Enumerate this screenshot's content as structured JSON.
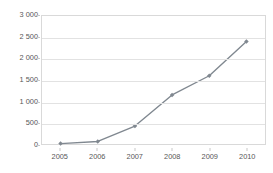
{
  "chart_data": {
    "type": "line",
    "title": "",
    "subtitle": "",
    "xlabel": "",
    "ylabel": "",
    "categories": [
      "2005",
      "2006",
      "2007",
      "2008",
      "2009",
      "2010"
    ],
    "series": [
      {
        "name": "",
        "values": [
          10,
          60,
          420,
          1150,
          1600,
          2400
        ],
        "color": "#808890",
        "marker": "diamond"
      }
    ],
    "ylim": [
      0,
      3000
    ],
    "ytick_values": [
      0,
      500,
      1000,
      1500,
      2000,
      2500,
      3000
    ],
    "ytick_labels": [
      "0",
      "500",
      "1 000",
      "1 500",
      "2 000",
      "2 500",
      "3 000"
    ],
    "xtick_labels": [
      "2005",
      "2006",
      "2007",
      "2008",
      "2009",
      "2010"
    ],
    "grid": true,
    "grid_axis": "y",
    "legend": false,
    "legend_position": "none",
    "annotations": []
  },
  "style": {
    "plot_border_color": "#d9d9d9",
    "gridline_color": "#e2e2e2",
    "tick_color": "#c8c8c8",
    "label_color": "#585858",
    "background": "#ffffff",
    "series_color": "#808890"
  }
}
